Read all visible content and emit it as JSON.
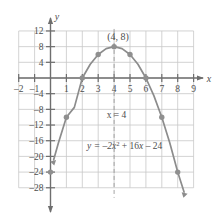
{
  "figure": {
    "axis_labels": {
      "x": "x",
      "y": "y"
    },
    "vertex_label": "(4, 8)",
    "axis_of_symmetry_label": "x = 4",
    "equation_label_parts": {
      "lead": "y = –2x",
      "exponent": "2",
      "tail": "+ 16x – 24"
    },
    "colors": {
      "curve": "#8c8c8c",
      "grid": "#c8c8c8",
      "axis": "#6e6e6e",
      "text": "#4d4d4d",
      "point": "#8f8f8f",
      "dashed": "#9a9a9a"
    },
    "x_ticks": [
      "-2",
      "-1",
      "1",
      "2",
      "3",
      "4",
      "5",
      "6",
      "7",
      "8",
      "9"
    ],
    "y_ticks": [
      "12",
      "8",
      "4",
      "-4",
      "-8",
      "-12",
      "-16",
      "-20",
      "-24",
      "-28"
    ]
  },
  "chart_data": {
    "type": "line",
    "title": "",
    "subtitle": "",
    "xlabel": "x",
    "ylabel": "y",
    "xlim": [
      -2.6,
      9.6
    ],
    "ylim": [
      -30.5,
      13.5
    ],
    "xticks": [
      -2,
      -1,
      0,
      1,
      2,
      3,
      4,
      5,
      6,
      7,
      8,
      9
    ],
    "yticks": [
      12,
      8,
      4,
      0,
      -4,
      -8,
      -12,
      -16,
      -20,
      -24,
      -28
    ],
    "grid": true,
    "legend": "none",
    "series": [
      {
        "name": "y = -2x^2 + 16x - 24",
        "equation": "y = -2x^2 + 16x - 24",
        "x": [
          0.2,
          0.5,
          1,
          1.5,
          2,
          2.5,
          3,
          3.5,
          4,
          4.5,
          5,
          5.5,
          6,
          6.5,
          7,
          7.5,
          8,
          8.4
        ],
        "values": [
          -20.88,
          -16.5,
          -10,
          -7.5,
          0,
          3.5,
          6,
          7.5,
          8,
          7.5,
          6,
          3.5,
          0,
          -4.5,
          -10,
          -16.5,
          -24,
          -29.1
        ]
      }
    ],
    "plotted_points": [
      {
        "x": 0,
        "y": -24,
        "label": ""
      },
      {
        "x": 1,
        "y": -10,
        "label": ""
      },
      {
        "x": 2,
        "y": 0,
        "label": ""
      },
      {
        "x": 3,
        "y": 6,
        "label": ""
      },
      {
        "x": 4,
        "y": 8,
        "label": "(4, 8)"
      },
      {
        "x": 5,
        "y": 6,
        "label": ""
      },
      {
        "x": 6,
        "y": 0,
        "label": ""
      },
      {
        "x": 7,
        "y": -10,
        "label": ""
      },
      {
        "x": 8,
        "y": -24,
        "label": ""
      }
    ],
    "annotations": [
      {
        "text": "(4, 8)",
        "x": 4.3,
        "y": 11
      },
      {
        "text": "x = 4",
        "x": 4.1,
        "y": -10.5
      },
      {
        "text": "y = -2x^2 + 16x - 24",
        "x": 2.3,
        "y": -18
      }
    ],
    "axis_of_symmetry": {
      "x": 4,
      "style": "dashed"
    }
  }
}
